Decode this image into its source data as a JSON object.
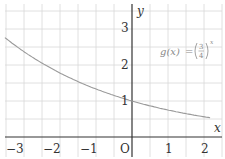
{
  "chart_data": {
    "type": "line",
    "title": "",
    "xlabel": "x",
    "ylabel": "y",
    "xlim": [
      -3.6,
      2.5
    ],
    "ylim": [
      0,
      3.5
    ],
    "grid": true,
    "grid_step": 0.5,
    "x_ticks": [
      -3,
      -2,
      -1,
      1,
      2
    ],
    "x_tick_labels": [
      "−3",
      "−2",
      "−1",
      "1",
      "2"
    ],
    "y_ticks": [
      1,
      2,
      3
    ],
    "y_tick_labels": [
      "1",
      "2",
      "3"
    ],
    "origin_label": "O",
    "series": [
      {
        "name": "g(x) = (3/4)^x",
        "function": "(3/4)^x",
        "x": [
          -3.5,
          -3,
          -2,
          -1,
          0,
          1,
          2,
          2.2
        ],
        "y": [
          2.74,
          2.37,
          1.78,
          1.33,
          1.0,
          0.75,
          0.56,
          0.53
        ]
      }
    ],
    "annotations": [
      {
        "text": "g(x) = (3/4)^x",
        "x": 1.3,
        "y": 2.1
      }
    ]
  },
  "labels": {
    "x_axis": "x",
    "y_axis": "y",
    "origin": "O",
    "func_lhs": "g(x)",
    "func_eq": "=",
    "frac_num": "3",
    "frac_den": "4",
    "exponent": "x",
    "xt": [
      "−3",
      "−2",
      "−1",
      "1",
      "2"
    ],
    "yt": [
      "1",
      "2",
      "3"
    ]
  },
  "colors": {
    "curve": "#9a9a9a",
    "axis": "#333333",
    "grid": "#d8d8d8"
  }
}
